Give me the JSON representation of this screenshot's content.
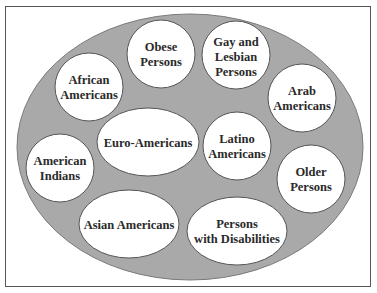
{
  "diagram": {
    "container_label": "",
    "colors": {
      "background": "#ffffff",
      "frame_border": "#555555",
      "outer_ellipse_fill": "#a9a9a9",
      "outer_ellipse_stroke": "#7a7a7a",
      "group_fill": "#ffffff",
      "group_stroke": "#555555",
      "text": "#2a2a2a"
    },
    "groups": [
      {
        "id": "obese-persons",
        "lines": [
          "Obese",
          "Persons"
        ]
      },
      {
        "id": "gay-lesbian-persons",
        "lines": [
          "Gay and",
          "Lesbian",
          "Persons"
        ]
      },
      {
        "id": "african-americans",
        "lines": [
          "African",
          "Americans"
        ]
      },
      {
        "id": "arab-americans",
        "lines": [
          "Arab",
          "Americans"
        ]
      },
      {
        "id": "euro-americans",
        "lines": [
          "Euro-Americans"
        ]
      },
      {
        "id": "latino-americans",
        "lines": [
          "Latino",
          "Americans"
        ]
      },
      {
        "id": "american-indians",
        "lines": [
          "American",
          "Indians"
        ]
      },
      {
        "id": "older-persons",
        "lines": [
          "Older",
          "Persons"
        ]
      },
      {
        "id": "asian-americans",
        "lines": [
          "Asian Americans"
        ]
      },
      {
        "id": "persons-with-disabilities",
        "lines": [
          "Persons",
          "with Disabilities"
        ]
      }
    ]
  }
}
